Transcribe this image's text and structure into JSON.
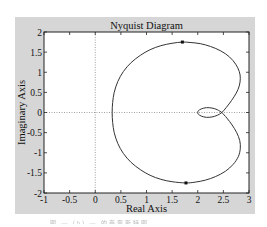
{
  "chart_data": {
    "type": "line",
    "title": "Nyquist Diagram",
    "xlabel": "Real Axis",
    "ylabel": "Imaginary Axis",
    "xlim": [
      -1,
      3
    ],
    "ylim": [
      -2,
      2
    ],
    "xticks": [
      -1,
      -0.5,
      0,
      0.5,
      1,
      1.5,
      2,
      2.5,
      3
    ],
    "xtick_labels": [
      "-1",
      "-0.5",
      "0",
      "0.5",
      "1",
      "1.5",
      "2",
      "2.5",
      "3"
    ],
    "yticks": [
      2,
      1.5,
      1,
      0.5,
      0,
      -0.5,
      -1,
      -1.5,
      -2
    ],
    "ytick_labels": [
      "2",
      "1.5",
      "1",
      "0.5",
      "0",
      "-0.5",
      "-1",
      "-1.5",
      "-2"
    ],
    "grid": false,
    "reference_lines": [
      {
        "orientation": "horizontal",
        "value": 0,
        "style": "dotted"
      },
      {
        "orientation": "vertical",
        "value": 0,
        "style": "dotted"
      }
    ],
    "series": [
      {
        "name": "Nyquist curve",
        "color": "#333333",
        "points": [
          [
            2.47,
            0.0
          ],
          [
            2.38,
            0.07
          ],
          [
            2.28,
            0.11
          ],
          [
            2.17,
            0.12
          ],
          [
            2.07,
            0.09
          ],
          [
            2.01,
            0.04
          ],
          [
            2.0,
            0.0
          ],
          [
            2.01,
            -0.04
          ],
          [
            2.07,
            -0.09
          ],
          [
            2.17,
            -0.12
          ],
          [
            2.28,
            -0.11
          ],
          [
            2.38,
            -0.07
          ],
          [
            2.47,
            0.0
          ],
          [
            2.56,
            0.13
          ],
          [
            2.66,
            0.3
          ],
          [
            2.75,
            0.48
          ],
          [
            2.81,
            0.66
          ],
          [
            2.83,
            0.85
          ],
          [
            2.81,
            1.02
          ],
          [
            2.74,
            1.2
          ],
          [
            2.62,
            1.38
          ],
          [
            2.45,
            1.53
          ],
          [
            2.25,
            1.64
          ],
          [
            2.05,
            1.71
          ],
          [
            1.85,
            1.74
          ],
          [
            1.7,
            1.75
          ],
          [
            1.5,
            1.72
          ],
          [
            1.28,
            1.66
          ],
          [
            1.07,
            1.56
          ],
          [
            0.88,
            1.42
          ],
          [
            0.7,
            1.24
          ],
          [
            0.55,
            1.02
          ],
          [
            0.44,
            0.77
          ],
          [
            0.37,
            0.5
          ],
          [
            0.34,
            0.25
          ],
          [
            0.33,
            0.0
          ],
          [
            0.34,
            -0.25
          ],
          [
            0.37,
            -0.5
          ],
          [
            0.44,
            -0.77
          ],
          [
            0.55,
            -1.02
          ],
          [
            0.7,
            -1.24
          ],
          [
            0.88,
            -1.42
          ],
          [
            1.07,
            -1.56
          ],
          [
            1.28,
            -1.66
          ],
          [
            1.5,
            -1.72
          ],
          [
            1.77,
            -1.75
          ],
          [
            1.95,
            -1.73
          ],
          [
            2.15,
            -1.68
          ],
          [
            2.35,
            -1.59
          ],
          [
            2.54,
            -1.46
          ],
          [
            2.69,
            -1.29
          ],
          [
            2.79,
            -1.1
          ],
          [
            2.83,
            -0.9
          ],
          [
            2.82,
            -0.7
          ],
          [
            2.76,
            -0.5
          ],
          [
            2.67,
            -0.31
          ],
          [
            2.57,
            -0.14
          ],
          [
            2.47,
            0.0
          ]
        ],
        "arrow_markers": [
          [
            1.7,
            1.75
          ],
          [
            1.77,
            -1.75
          ]
        ]
      }
    ]
  },
  "caption": "图 — (b) — 的奈奎斯特图"
}
